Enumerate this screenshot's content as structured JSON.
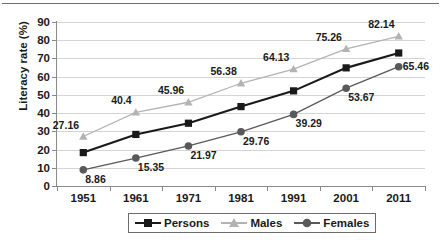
{
  "chart_data": {
    "type": "line",
    "title": "",
    "xlabel": "",
    "ylabel": "Literacy rate (%)",
    "categories": [
      "1951",
      "1961",
      "1971",
      "1981",
      "1991",
      "2001",
      "2011"
    ],
    "ylim": [
      0,
      90
    ],
    "yticks": [
      0,
      10,
      20,
      30,
      40,
      50,
      60,
      70,
      80,
      90
    ],
    "grid": true,
    "legend_position": "bottom-center",
    "series": [
      {
        "name": "Persons",
        "color": "#1a1a1a",
        "marker": "square",
        "values": [
          18.33,
          28.3,
          34.45,
          43.57,
          52.21,
          64.83,
          72.99
        ],
        "labels": [
          "",
          "",
          "",
          "",
          "",
          "",
          ""
        ]
      },
      {
        "name": "Males",
        "color": "#b3b3b3",
        "marker": "triangle",
        "values": [
          27.16,
          40.4,
          45.96,
          56.38,
          64.13,
          75.26,
          82.14
        ],
        "labels": [
          "27.16",
          "40.4",
          "45.96",
          "56.38",
          "64.13",
          "75.26",
          "82.14"
        ]
      },
      {
        "name": "Females",
        "color": "#595959",
        "marker": "circle",
        "values": [
          8.86,
          15.35,
          21.97,
          29.76,
          39.29,
          53.67,
          65.46
        ],
        "labels": [
          "8.86",
          "15.35",
          "21.97",
          "29.76",
          "39.29",
          "53.67",
          "65.46"
        ]
      }
    ]
  },
  "axis": {
    "y_tick_labels": [
      "90",
      "80",
      "70",
      "60",
      "50",
      "40",
      "30",
      "20",
      "10",
      "0"
    ],
    "x_tick_labels": [
      "1951",
      "1961",
      "1971",
      "1981",
      "1991",
      "2001",
      "2011"
    ],
    "y_title": "Literacy rate (%)"
  },
  "legend": {
    "items": [
      {
        "label": "Persons",
        "color": "#1a1a1a",
        "marker": "square"
      },
      {
        "label": "Males",
        "color": "#b3b3b3",
        "marker": "triangle"
      },
      {
        "label": "Females",
        "color": "#595959",
        "marker": "circle"
      }
    ]
  },
  "data_labels": {
    "males": [
      "27.16",
      "40.4",
      "45.96",
      "56.38",
      "64.13",
      "75.26",
      "82.14"
    ],
    "females": [
      "8.86",
      "15.35",
      "21.97",
      "29.76",
      "39.29",
      "53.67",
      "65.46"
    ]
  }
}
